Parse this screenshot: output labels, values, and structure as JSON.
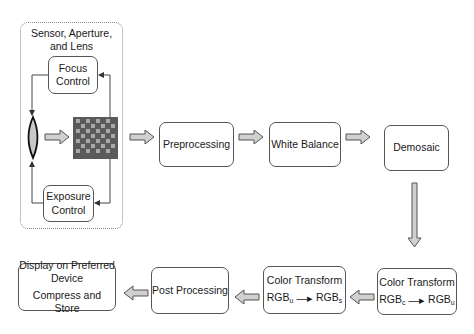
{
  "diagram": {
    "type": "camera image processing pipeline",
    "group": {
      "title_line1": "Sensor, Aperture,",
      "title_line2": "and Lens",
      "focus": {
        "line1": "Focus",
        "line2": "Control"
      },
      "exposure": {
        "line1": "Exposure",
        "line2": "Control"
      },
      "lens_icon": "lens-icon",
      "sensor_icon": "bayer-sensor-icon"
    },
    "stages": {
      "preprocessing": "Preprocessing",
      "white_balance": "White Balance",
      "demosaic": "Demosaic",
      "color_transform_1": {
        "label": "Color Transform",
        "from": "RGB",
        "from_sub": "c",
        "to": "RGB",
        "to_sub": "u"
      },
      "color_transform_2": {
        "label": "Color Transform",
        "from": "RGB",
        "from_sub": "u",
        "to": "RGB",
        "to_sub": "s"
      },
      "post_processing": "Post Processing",
      "output": {
        "line1": "Display on Preferred",
        "line2": "Device",
        "line3": "Compress and Store"
      }
    },
    "colors": {
      "border": "#555555",
      "arrow_fill": "#d0d0d0",
      "sensor_dark": "#5a5a5a",
      "sensor_light": "#a8a8a8"
    }
  }
}
